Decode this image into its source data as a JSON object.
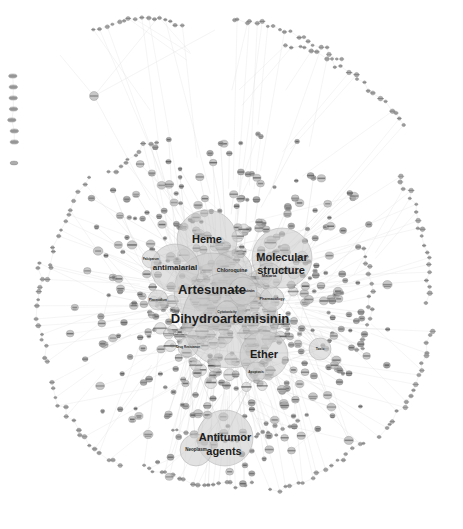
{
  "figure": {
    "type": "network-graph",
    "title": "",
    "background_color": "#ffffff",
    "node_color": "#c8c8c8",
    "edge_color": "#c9c9c9",
    "label_color": "#1c1c1c",
    "width": 463,
    "height": 529
  },
  "chart_data": {
    "type": "scatter",
    "title": "",
    "xlabel": "",
    "ylabel": "",
    "hub_nodes": [
      {
        "label": "Heme",
        "x": 207,
        "y": 240,
        "r": 30,
        "font": 11
      },
      {
        "label": "Molecular",
        "x": 282,
        "y": 258,
        "r": 30,
        "font": 11
      },
      {
        "label": "structure",
        "x": 281,
        "y": 271,
        "r": 0,
        "font": 11
      },
      {
        "label": "Chloroquine",
        "x": 232,
        "y": 271,
        "r": 20,
        "font": 5.2
      },
      {
        "label": "Artesunate",
        "x": 212,
        "y": 291,
        "r": 38,
        "font": 13
      },
      {
        "label": "Dihydroartemisinin",
        "x": 230,
        "y": 320,
        "r": 48,
        "font": 13
      },
      {
        "label": "Ether",
        "x": 264,
        "y": 355,
        "r": 24,
        "font": 11
      },
      {
        "label": "Antitumor",
        "x": 225,
        "y": 438,
        "r": 28,
        "font": 11
      },
      {
        "label": "agents",
        "x": 224,
        "y": 452,
        "r": 0,
        "font": 11
      },
      {
        "label": "antimalarial",
        "x": 175,
        "y": 268,
        "r": 24,
        "font": 8
      },
      {
        "label": "Neoplasm",
        "x": 196,
        "y": 450,
        "r": 16,
        "font": 4.5
      },
      {
        "label": "Malaria",
        "x": 269,
        "y": 276,
        "r": 13,
        "font": 4.2
      },
      {
        "label": "Artemisinin",
        "x": 243,
        "y": 291,
        "r": 14,
        "font": 4.2
      },
      {
        "label": "Pharmacology",
        "x": 272,
        "y": 299,
        "r": 12,
        "font": 3.6
      },
      {
        "label": "Cytotoxicity",
        "x": 227,
        "y": 312,
        "r": 11,
        "font": 3.4
      },
      {
        "label": "Toxic",
        "x": 320,
        "y": 349,
        "r": 11,
        "font": 3.4
      },
      {
        "label": "Drug Resistance",
        "x": 188,
        "y": 347,
        "r": 10,
        "font": 3.0
      },
      {
        "label": "Apoptosis",
        "x": 256,
        "y": 372,
        "r": 10,
        "font": 3.2
      },
      {
        "label": "Plasmodium",
        "x": 158,
        "y": 300,
        "r": 10,
        "font": 3.0
      },
      {
        "label": "Falciparum",
        "x": 151,
        "y": 259,
        "r": 9,
        "font": 3.0
      }
    ],
    "label_texts": [
      "Heme",
      "Molecular structure",
      "Chloroquine",
      "Artesunate",
      "Dihydroartemisinin",
      "Ether",
      "Antitumor agents",
      "antimalarial",
      "Neoplasm",
      "Malaria",
      "Artemisinin",
      "Pharmacology",
      "Cytotoxicity",
      "Toxic",
      "Drug Resistance",
      "Apoptosis",
      "Plasmodium",
      "Falciparum"
    ],
    "node_count_estimate": 620,
    "edge_count_estimate": 900,
    "layout": "force-directed radial",
    "color_scale": "grayscale",
    "legend": [],
    "grid": false
  }
}
